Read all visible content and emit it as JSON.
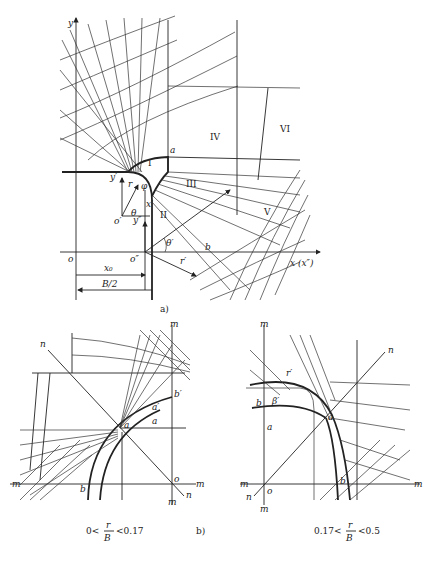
{
  "figure_a": {
    "caption": "a)",
    "axis_y": "y",
    "axis_x": "x (x″)",
    "origin_o": "o",
    "origin_o_prime": "o′",
    "origin_o_double": "o″",
    "y_prime": "y′",
    "y_double": "y″",
    "x_prime": "x′",
    "point_a": "a",
    "point_b": "b",
    "theta": "θ",
    "theta_prime": "θ′",
    "r_label": "r",
    "r_prime": "r′",
    "phi": "φ",
    "x0": "x₀",
    "half_width": "B/2",
    "regions": [
      "I",
      "II",
      "III",
      "IV",
      "V",
      "VI"
    ]
  },
  "figure_b": {
    "caption": "b)",
    "left": {
      "condition_prefix": "0<",
      "fraction_num": "r",
      "fraction_den": "B",
      "condition_suffix": "<0.17",
      "labels": {
        "m": "m",
        "n": "n",
        "o": "o",
        "a": "a",
        "a_prime": "a′",
        "b": "b",
        "b_prime": "b′"
      }
    },
    "right": {
      "condition_prefix": "0.17<",
      "fraction_num": "r",
      "fraction_den": "B",
      "condition_suffix": "<0.5",
      "labels": {
        "m": "m",
        "n": "n",
        "o": "o",
        "a": "a",
        "a_prime": "a′",
        "b": "b",
        "b_prime": "b′",
        "beta": "β′",
        "r": "r′"
      }
    }
  }
}
